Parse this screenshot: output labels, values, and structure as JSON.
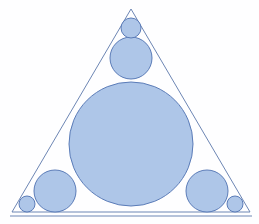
{
  "figure": {
    "caption_strip": "",
    "background_color": "#fefeff",
    "fill_color": "#aec6e8",
    "stroke_color": "#5b7cb8",
    "line_color": "#6d86b4",
    "stroke_width": 1,
    "canvas": {
      "width": 259,
      "height": 224
    }
  },
  "triangle": {
    "name": "outer-triangle",
    "apex": {
      "x": 131,
      "y": 9
    },
    "bottom_left": {
      "x": 12,
      "y": 212
    },
    "bottom_right": {
      "x": 250,
      "y": 212
    },
    "points": "131,9 12,212 250,212"
  },
  "baseline": {
    "name": "baseline",
    "x1": 10,
    "y1": 216,
    "x2": 252,
    "y2": 216
  },
  "circles": [
    {
      "id": "incircle",
      "label": "large-incircle",
      "cx": 131,
      "cy": 144,
      "r": 62
    },
    {
      "id": "top-medium",
      "label": "apex-medium-circle",
      "cx": 131,
      "cy": 58,
      "r": 21
    },
    {
      "id": "bottom-left-medium",
      "label": "left-medium-circle",
      "cx": 55,
      "cy": 191,
      "r": 21
    },
    {
      "id": "bottom-right-medium",
      "label": "right-medium-circle",
      "cx": 207,
      "cy": 191,
      "r": 21
    },
    {
      "id": "apex-small",
      "label": "apex-small-circle",
      "cx": 131,
      "cy": 28,
      "r": 10
    },
    {
      "id": "bottom-left-small",
      "label": "left-corner-small-circle",
      "cx": 27,
      "cy": 204,
      "r": 8
    },
    {
      "id": "bottom-right-small",
      "label": "right-corner-small-circle",
      "cx": 235,
      "cy": 204,
      "r": 8
    }
  ]
}
